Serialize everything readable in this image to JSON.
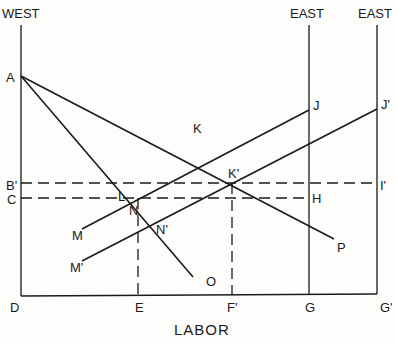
{
  "diagram": {
    "axis_titles": {
      "west": "WEST",
      "east": "EAST",
      "east_prime": "EAST",
      "x_axis": "LABOR"
    },
    "points": {
      "A": "A",
      "B_prime": "B'",
      "C": "C",
      "D": "D",
      "E": "E",
      "F_prime": "F'",
      "G": "G",
      "G_prime": "G'",
      "H": "H",
      "I_prime": "I'",
      "J": "J",
      "J_prime": "J'",
      "K": "K",
      "K_prime": "K'",
      "L": "L",
      "M": "M",
      "M_prime": "M'",
      "N": "N",
      "N_prime": "N'",
      "O": "O",
      "P": "P"
    },
    "lines": [
      {
        "from": "A",
        "to": "O",
        "style": "solid"
      },
      {
        "from": "A",
        "to": "P",
        "style": "solid"
      },
      {
        "from": "M",
        "to": "J",
        "style": "solid"
      },
      {
        "from": "M'",
        "to": "J'",
        "style": "solid"
      },
      {
        "from": "B'",
        "to": "I'",
        "style": "dashed"
      },
      {
        "from": "C",
        "to": "H",
        "style": "dashed"
      },
      {
        "from": "N",
        "to": "E",
        "style": "dashed"
      },
      {
        "from": "K'",
        "to": "F'",
        "style": "dashed"
      },
      {
        "from": "D",
        "to": "G'",
        "style": "axis"
      }
    ]
  }
}
